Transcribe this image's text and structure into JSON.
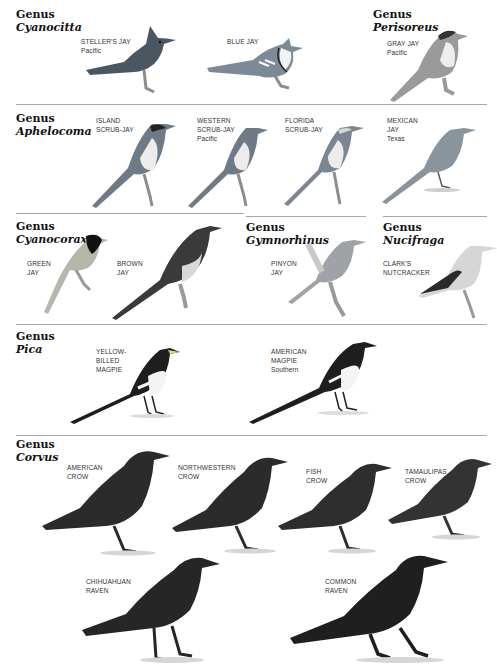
{
  "sections": [
    {
      "genus_label": "Genus",
      "genus_name": "Cyanocitta",
      "species": [
        {
          "name_lines": [
            "STELLER'S JAY"
          ],
          "region": "Pacific"
        },
        {
          "name_lines": [
            "BLUE JAY"
          ],
          "region": ""
        }
      ]
    },
    {
      "genus_label": "Genus",
      "genus_name": "Perisoreus",
      "species": [
        {
          "name_lines": [
            "GRAY JAY"
          ],
          "region": "Pacific"
        }
      ]
    },
    {
      "genus_label": "Genus",
      "genus_name": "Aphelocoma",
      "species": [
        {
          "name_lines": [
            "ISLAND",
            "SCRUB-JAY"
          ],
          "region": ""
        },
        {
          "name_lines": [
            "WESTERN",
            "SCRUB-JAY"
          ],
          "region": "Pacific"
        },
        {
          "name_lines": [
            "FLORIDA",
            "SCRUB-JAY"
          ],
          "region": ""
        },
        {
          "name_lines": [
            "MEXICAN",
            "JAY"
          ],
          "region": "Texas"
        }
      ]
    },
    {
      "genus_label": "Genus",
      "genus_name": "Cyanocorax",
      "species": [
        {
          "name_lines": [
            "GREEN",
            "JAY"
          ],
          "region": ""
        },
        {
          "name_lines": [
            "BROWN",
            "JAY"
          ],
          "region": ""
        }
      ]
    },
    {
      "genus_label": "Genus",
      "genus_name": "Gymnorhinus",
      "species": [
        {
          "name_lines": [
            "PINYON",
            "JAY"
          ],
          "region": ""
        }
      ]
    },
    {
      "genus_label": "Genus",
      "genus_name": "Nucifraga",
      "species": [
        {
          "name_lines": [
            "CLARK'S",
            "NUTCRACKER"
          ],
          "region": ""
        }
      ]
    },
    {
      "genus_label": "Genus",
      "genus_name": "Pica",
      "species": [
        {
          "name_lines": [
            "YELLOW-",
            "BILLED",
            "MAGPIE"
          ],
          "region": ""
        },
        {
          "name_lines": [
            "AMERICAN",
            "MAGPIE"
          ],
          "region": "Southern"
        }
      ]
    },
    {
      "genus_label": "Genus",
      "genus_name": "Corvus",
      "species": [
        {
          "name_lines": [
            "AMERICAN",
            "CROW"
          ],
          "region": ""
        },
        {
          "name_lines": [
            "NORTHWESTERN",
            "CROW"
          ],
          "region": ""
        },
        {
          "name_lines": [
            "FISH",
            "CROW"
          ],
          "region": ""
        },
        {
          "name_lines": [
            "TAMAULIPAS",
            "CROW"
          ],
          "region": ""
        },
        {
          "name_lines": [
            "CHIHUAHUAN",
            "RAVEN"
          ],
          "region": ""
        },
        {
          "name_lines": [
            "COMMON",
            "RAVEN"
          ],
          "region": ""
        }
      ]
    }
  ],
  "colors": {
    "rule": "#a8a8a8",
    "steller_jay": "#4a5660",
    "blue_jay": "#7d8a96",
    "gray_jay": "#9a9a9a",
    "scrub_jay": "#6e7a86",
    "green_jay": "#b4b8aa",
    "brown_jay": "#3a3a3a",
    "pinyon_jay": "#9fa3a8",
    "nutcracker": "#d6d6d6",
    "magpie": "#1e1e1e",
    "crow": "#2b2b2b"
  }
}
